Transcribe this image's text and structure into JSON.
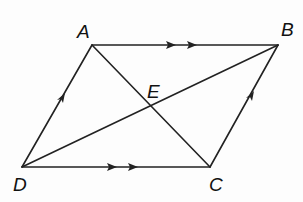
{
  "diagram": {
    "type": "parallelogram-with-diagonals",
    "labels": {
      "A": "A",
      "B": "B",
      "C": "C",
      "D": "D",
      "E": "E"
    },
    "points": {
      "A": [
        92,
        45
      ],
      "B": [
        278,
        45
      ],
      "C": [
        210,
        167
      ],
      "D": [
        22,
        167
      ],
      "E": [
        151,
        106
      ]
    },
    "segments": [
      {
        "from": "A",
        "to": "B",
        "marks": "double-arrow"
      },
      {
        "from": "D",
        "to": "C",
        "marks": "double-arrow"
      },
      {
        "from": "D",
        "to": "A",
        "marks": "single-arrow"
      },
      {
        "from": "C",
        "to": "B",
        "marks": "single-arrow"
      },
      {
        "from": "A",
        "to": "C",
        "marks": "none"
      },
      {
        "from": "D",
        "to": "B",
        "marks": "none"
      }
    ],
    "colors": {
      "line": "#222222",
      "background": "#fdfdfd"
    }
  }
}
